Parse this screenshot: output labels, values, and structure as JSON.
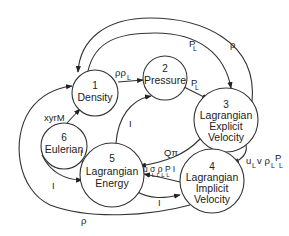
{
  "diagram": {
    "nodes": [
      {
        "id": "1",
        "number": "1",
        "lines": [
          "Density"
        ]
      },
      {
        "id": "2",
        "number": "2",
        "lines": [
          "Pressure"
        ]
      },
      {
        "id": "3",
        "number": "3",
        "lines": [
          "Lagrangian",
          "Explicit",
          "Velocity"
        ]
      },
      {
        "id": "4",
        "number": "4",
        "lines": [
          "Lagrangian",
          "Implicit",
          "Velocity"
        ]
      },
      {
        "id": "5",
        "number": "5",
        "lines": [
          "Lagrangian",
          "Energy"
        ]
      },
      {
        "id": "6",
        "number": "6",
        "lines": [
          "Eulerian"
        ]
      }
    ],
    "edges": [
      {
        "from": "1",
        "to": "2",
        "label": "ρρ",
        "sub": "L"
      },
      {
        "from": "2",
        "to": "3",
        "label": "P",
        "sub": "L"
      },
      {
        "from": "1",
        "to": "3",
        "label": "P",
        "sub": "L"
      },
      {
        "from": "3",
        "to": "1",
        "label": "ρ",
        "sub": ""
      },
      {
        "from": "6",
        "to": "1",
        "label": "xyrM",
        "sub": ""
      },
      {
        "from": "5",
        "to": "2",
        "label": "I",
        "sub": ""
      },
      {
        "from": "3",
        "to": "5",
        "label": "Qπ",
        "sub": ""
      },
      {
        "from": "3",
        "to": "4",
        "label": "u v ρP",
        "sub": "L  LL"
      },
      {
        "from": "4",
        "to": "5",
        "label": "uσρPI",
        "sub": "L L L L L"
      },
      {
        "from": "5",
        "to": "4",
        "label": "I",
        "sub": ""
      },
      {
        "from": "5",
        "to": "6",
        "label": "I",
        "sub": ""
      },
      {
        "from": "6",
        "to": "5",
        "label": "I",
        "sub": ""
      },
      {
        "from": "4",
        "to": "1",
        "label": "ρ",
        "sub": ""
      }
    ]
  },
  "labels": {
    "n1_num": "1",
    "n1_l1": "Density",
    "n2_num": "2",
    "n2_l1": "Pressure",
    "n3_num": "3",
    "n3_l1": "Lagrangian",
    "n3_l2": "Explicit",
    "n3_l3": "Velocity",
    "n4_num": "4",
    "n4_l1": "Lagrangian",
    "n4_l2": "Implicit",
    "n4_l3": "Velocity",
    "n5_num": "5",
    "n5_l1": "Lagrangian",
    "n5_l2": "Energy",
    "n6_num": "6",
    "n6_l1": "Eulerian",
    "e12": "ρρ",
    "e12_sub": "L",
    "e23": "P",
    "e23_sub": "L",
    "e13": "P",
    "e13_sub": "L",
    "e31": "ρ",
    "e61": "xyrM",
    "e52": "I",
    "e35": "Qπ",
    "e34_a": "u",
    "e34_a_sub": "L",
    "e34_b": "v ρ",
    "e34_b_sub": "L",
    "e34_c": "P",
    "e34_c_sub": "L",
    "e45": "u σ ρ P I",
    "e45_sub": "L L L L L",
    "e54": "I",
    "e56": "I",
    "e65": "I",
    "e41": "ρ"
  }
}
